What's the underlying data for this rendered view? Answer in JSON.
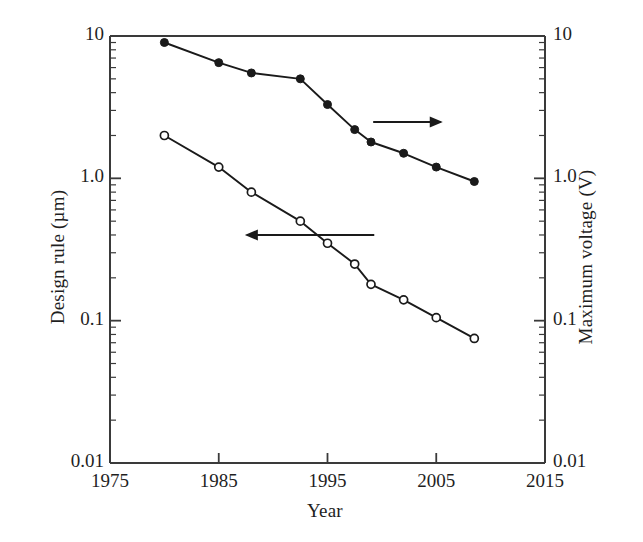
{
  "chart_data": {
    "type": "line",
    "title": "",
    "xlabel": "Year",
    "ylabel": "Design rule (µm)",
    "y2label": "Maximum voltage (V)",
    "xlim": [
      1975,
      2015
    ],
    "ylim": [
      0.01,
      10
    ],
    "y2lim": [
      0.01,
      10
    ],
    "yscale": "log",
    "y2scale": "log",
    "grid": false,
    "legend": "none",
    "xticks": [
      "1975",
      "1985",
      "1995",
      "2005",
      "2015"
    ],
    "xtick_values": [
      1975,
      1985,
      1995,
      2005,
      2015
    ],
    "yticks": [
      "10",
      "1.0",
      "0.1",
      "0.01"
    ],
    "ytick_values": [
      10,
      1.0,
      0.1,
      0.01
    ],
    "y2ticks": [
      "10",
      "1.0",
      "0.1",
      "0.01"
    ],
    "y2tick_values": [
      10,
      1.0,
      0.1,
      0.01
    ],
    "series": [
      {
        "name": "Design rule (µm)",
        "axis": "left",
        "marker": "open-circle",
        "x": [
          1980,
          1985,
          1988,
          1992.5,
          1995,
          1997.5,
          1999,
          2002,
          2005,
          2008.5
        ],
        "values": [
          2.0,
          1.2,
          0.8,
          0.5,
          0.35,
          0.25,
          0.18,
          0.14,
          0.105,
          0.075
        ]
      },
      {
        "name": "Maximum voltage (V)",
        "axis": "right",
        "marker": "filled-circle",
        "x": [
          1980,
          1985,
          1988,
          1992.5,
          1995,
          1997.5,
          1999,
          2002,
          2005,
          2008.5
        ],
        "values": [
          9.0,
          6.5,
          5.5,
          5.0,
          3.3,
          2.2,
          1.8,
          1.5,
          1.2,
          0.95
        ]
      }
    ],
    "annotations": [
      {
        "name": "arrow-to-left-axis",
        "type": "arrow",
        "direction": "left",
        "label": "",
        "from_x": 1987.4,
        "to_x": 1999.3,
        "y_px": 235
      },
      {
        "name": "arrow-to-right-axis",
        "type": "arrow",
        "direction": "right",
        "label": "",
        "from_x": 1999.2,
        "to_x": 2005.6,
        "y_px": 122
      }
    ]
  },
  "axes": {
    "left_title": "Design rule (µm)",
    "right_title": "Maximum voltage (V)",
    "bottom_title": "Year"
  },
  "colors": {
    "line": "#1a1a1a",
    "axis": "#3a3a3a",
    "text": "#1f1f1f",
    "background": "#ffffff"
  }
}
